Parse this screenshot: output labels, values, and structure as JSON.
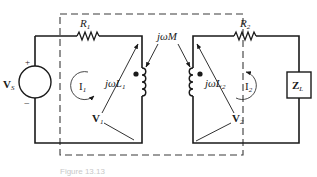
{
  "diagram": {
    "type": "mutually-coupled-inductor-circuit",
    "components": {
      "source": {
        "label": "V",
        "subscript": "S",
        "plus": "+",
        "minus": "−"
      },
      "r1": {
        "label": "R",
        "subscript": "1"
      },
      "r2": {
        "label": "R",
        "subscript": "2"
      },
      "l1": {
        "label": "jωL",
        "subscript": "1"
      },
      "l2": {
        "label": "jωL",
        "subscript": "2"
      },
      "mutual": {
        "label": "jωM"
      },
      "load": {
        "label": "Z",
        "subscript": "L"
      }
    },
    "currents": {
      "i1": {
        "label": "I",
        "subscript": "1"
      },
      "i2": {
        "label": "I",
        "subscript": "2"
      }
    },
    "voltages": {
      "v1": {
        "label": "V",
        "subscript": "1"
      },
      "v2": {
        "label": "V",
        "subscript": "2"
      }
    },
    "caption": "Figure 13.13"
  },
  "colors": {
    "line": "#1a1a1a",
    "dashed_box": "#3a3a3a",
    "caption": "#c8c8c8"
  }
}
